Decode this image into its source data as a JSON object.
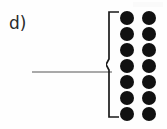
{
  "figure": {
    "panel_label": "d)",
    "background_color": "#fefefe",
    "width": 167,
    "height": 129
  },
  "leader_line": {
    "name": "pointer-line",
    "color": "#a9a9a9",
    "orientation": "horizontal",
    "length_px": 80
  },
  "brace": {
    "name": "curly-brace",
    "style": "angular-left-brace",
    "color": "#1a1a1a",
    "stroke_width": 1.6,
    "opens_toward": "right"
  },
  "dot_grid": {
    "name": "dot-array",
    "rows": 7,
    "columns": 2,
    "total_dots": 14,
    "dot_color": "#111111",
    "dot_diameter_px": 14,
    "rows_data": [
      [
        "dot",
        "dot"
      ],
      [
        "dot",
        "dot"
      ],
      [
        "dot",
        "dot"
      ],
      [
        "dot",
        "dot"
      ],
      [
        "dot",
        "dot"
      ],
      [
        "dot",
        "dot"
      ],
      [
        "dot",
        "dot"
      ]
    ]
  },
  "artifact": {
    "name": "scan-artifact",
    "color": "#fafafa"
  }
}
